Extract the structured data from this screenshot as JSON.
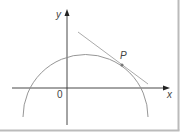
{
  "figure": {
    "labels": {
      "y_axis": "y",
      "x_axis": "x",
      "origin": "0",
      "point": "P"
    },
    "colors": {
      "axis": "#333333",
      "curve": "#8a8a8a",
      "tangent": "#9a9a9a",
      "point": "#777777",
      "border": "#bbbbbb",
      "background": "#ffffff"
    },
    "elements": {
      "curve": "circular arc (upper portion of circle)",
      "tangent": "tangent line to curve at P",
      "point": "P"
    }
  }
}
